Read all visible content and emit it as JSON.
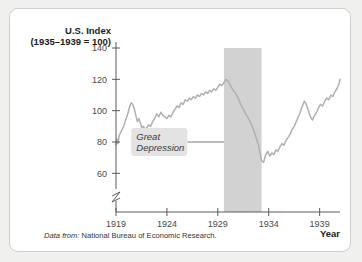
{
  "figure": {
    "source_note_lead": "Data from:",
    "source_note_text": "National Bureau of Economic Research."
  },
  "chart_data": {
    "type": "line",
    "title": "",
    "ylabel_line1": "U.S. Index",
    "ylabel_line2": "(1935–1939 = 100)",
    "xlabel": "Year",
    "xlim": [
      1919,
      1941
    ],
    "ylim": [
      50,
      140
    ],
    "axis_break": true,
    "grid": false,
    "legend": "none",
    "line_color": "#b0b0b0",
    "band_color": "#d2d2d2",
    "yticks": [
      60,
      80,
      100,
      120,
      140
    ],
    "ytick_labels": [
      "60",
      "80",
      "100",
      "120",
      "140"
    ],
    "xticks": [
      1919,
      1924,
      1929,
      1934,
      1939
    ],
    "xtick_labels": [
      "1919",
      "1924",
      "1929",
      "1934",
      "1939"
    ],
    "annotations": [
      {
        "label_line1": "Great",
        "label_line2": "Depression",
        "leader_y_value": 80,
        "leader_x_from": 1926.0,
        "leader_x_to": 1929.6
      }
    ],
    "shaded_bands": [
      {
        "name": "great-depression-band",
        "x_start": 1929.6,
        "x_end": 1933.3,
        "y_top": 140
      }
    ],
    "series": [
      {
        "name": "U.S. Index (1935-1939 = 100)",
        "x": [
          1919.0,
          1919.1,
          1919.2,
          1919.3,
          1919.45,
          1919.6,
          1919.75,
          1919.9,
          1920.05,
          1920.2,
          1920.35,
          1920.5,
          1920.65,
          1920.8,
          1920.95,
          1921.1,
          1921.25,
          1921.4,
          1921.55,
          1921.7,
          1921.85,
          1922.0,
          1922.2,
          1922.4,
          1922.6,
          1922.8,
          1923.0,
          1923.2,
          1923.4,
          1923.6,
          1923.8,
          1924.0,
          1924.2,
          1924.4,
          1924.6,
          1924.8,
          1925.0,
          1925.2,
          1925.4,
          1925.6,
          1925.8,
          1926.0,
          1926.2,
          1926.4,
          1926.6,
          1926.8,
          1927.0,
          1927.2,
          1927.4,
          1927.6,
          1927.8,
          1928.0,
          1928.2,
          1928.4,
          1928.6,
          1928.8,
          1929.0,
          1929.2,
          1929.4,
          1929.6,
          1929.8,
          1930.0,
          1930.25,
          1930.5,
          1930.75,
          1931.0,
          1931.25,
          1931.5,
          1931.75,
          1932.0,
          1932.25,
          1932.5,
          1932.7,
          1932.9,
          1933.0,
          1933.15,
          1933.3,
          1933.5,
          1933.7,
          1933.9,
          1934.1,
          1934.3,
          1934.5,
          1934.7,
          1934.9,
          1935.1,
          1935.3,
          1935.5,
          1935.7,
          1935.9,
          1936.1,
          1936.3,
          1936.5,
          1936.7,
          1936.9,
          1937.1,
          1937.3,
          1937.5,
          1937.7,
          1937.9,
          1938.1,
          1938.3,
          1938.5,
          1938.7,
          1938.9,
          1939.1,
          1939.3,
          1939.5,
          1939.7,
          1939.9,
          1940.1,
          1940.3,
          1940.5,
          1940.7,
          1940.9,
          1941.0
        ],
        "values": [
          78,
          82,
          79,
          84,
          86,
          88,
          90,
          93,
          96,
          99,
          103,
          105,
          104,
          101,
          97,
          93,
          95,
          92,
          89,
          90,
          88,
          89,
          91,
          90,
          93,
          95,
          98,
          96,
          99,
          97,
          96,
          95,
          97,
          96,
          99,
          101,
          103,
          102,
          105,
          104,
          107,
          106,
          108,
          107,
          109,
          108,
          110,
          109,
          111,
          110,
          112,
          111,
          113,
          112,
          114,
          113,
          115,
          117,
          116,
          118,
          120,
          119,
          116,
          113,
          111,
          108,
          104,
          101,
          98,
          95,
          92,
          88,
          84,
          80,
          78,
          73,
          68,
          67,
          72,
          74,
          71,
          73,
          72,
          75,
          74,
          77,
          79,
          78,
          81,
          83,
          85,
          88,
          90,
          93,
          96,
          99,
          103,
          106,
          104,
          100,
          96,
          94,
          97,
          99,
          102,
          104,
          103,
          106,
          108,
          107,
          110,
          109,
          112,
          114,
          117,
          120
        ]
      }
    ]
  }
}
